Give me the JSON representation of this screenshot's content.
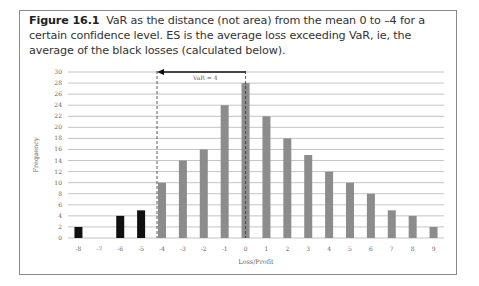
{
  "figure": {
    "label": "Figure 16.1",
    "caption": "VaR as the distance (not area) from the mean 0 to –4 for a certain confidence level. ES is the average loss exceeding VaR, ie, the average of the black losses (calculated below)."
  },
  "chart_data": {
    "type": "bar",
    "title": "",
    "xlabel": "Loss/Profit",
    "ylabel": "Frequency",
    "categories": [
      "-8",
      "-7",
      "-6",
      "-5",
      "-4",
      "-3",
      "-2",
      "-1",
      "0",
      "1",
      "2",
      "3",
      "4",
      "5",
      "6",
      "7",
      "8",
      "9"
    ],
    "values": [
      2,
      0,
      4,
      5,
      10,
      14,
      16,
      24,
      28,
      22,
      18,
      15,
      12,
      10,
      8,
      5,
      4,
      2
    ],
    "bar_colors": [
      "black",
      "black",
      "black",
      "black",
      "gray",
      "gray",
      "gray",
      "gray",
      "gray",
      "gray",
      "gray",
      "gray",
      "gray",
      "gray",
      "gray",
      "gray",
      "gray",
      "gray"
    ],
    "ylim": [
      0,
      30
    ],
    "yticks": [
      0,
      2,
      4,
      6,
      8,
      10,
      12,
      14,
      16,
      18,
      20,
      22,
      24,
      26,
      28,
      30
    ],
    "grid": true,
    "legend": null,
    "annotations": [
      {
        "type": "dashed-vline",
        "x": "-4"
      },
      {
        "type": "dashed-vline",
        "x": "0"
      },
      {
        "type": "arrow",
        "from": "0",
        "to": "-4",
        "y": 30,
        "label": "VaR = 4"
      }
    ],
    "colors": {
      "tail": "#111111",
      "body": "#8c8c8c",
      "grid": "#b5b5b5"
    }
  }
}
